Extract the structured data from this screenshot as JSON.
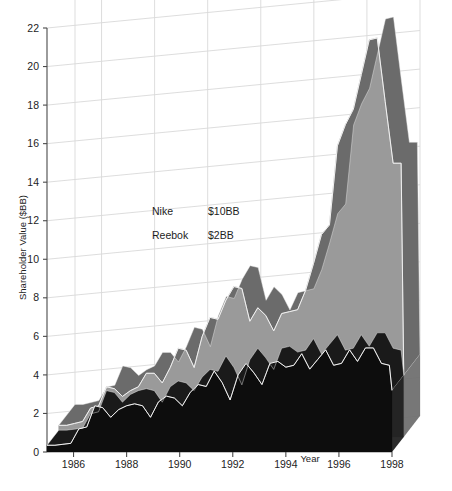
{
  "chart_data": {
    "type": "area",
    "title": "",
    "subtitle": "",
    "xlabel": "Year",
    "ylabel": "Shareholder Value ($BB)",
    "xlim": [
      1985,
      1998
    ],
    "ylim": [
      0,
      22
    ],
    "ytick_step": 2,
    "grid": true,
    "legend_position": "inside-upper-left",
    "style": "3d-ribbon",
    "y_ticks": [
      0,
      2,
      4,
      6,
      8,
      10,
      12,
      14,
      16,
      18,
      20,
      22
    ],
    "x_ticks": [
      1986,
      1988,
      1990,
      1992,
      1994,
      1996,
      1998
    ],
    "annotations": [
      {
        "label": "Nike",
        "value": "$10BB"
      },
      {
        "label": "Reebok",
        "value": "$2BB"
      }
    ],
    "x": [
      1985.0,
      1985.3,
      1985.6,
      1985.9,
      1986.2,
      1986.5,
      1986.8,
      1987.1,
      1987.4,
      1987.7,
      1988.0,
      1988.3,
      1988.6,
      1988.9,
      1989.2,
      1989.5,
      1989.8,
      1990.1,
      1990.4,
      1990.7,
      1991.0,
      1991.3,
      1991.6,
      1991.9,
      1992.2,
      1992.5,
      1992.8,
      1993.1,
      1993.4,
      1993.7,
      1994.0,
      1994.3,
      1994.6,
      1994.9,
      1995.2,
      1995.5,
      1995.8,
      1996.1,
      1996.4,
      1996.7,
      1997.0,
      1997.3,
      1997.6,
      1997.9,
      1998.0
    ],
    "series": [
      {
        "name": "Nike",
        "color_top": "#6b6b6b",
        "color_front": "#9a9a9a",
        "annotation": "$10BB",
        "values": [
          0.6,
          0.6,
          0.7,
          0.8,
          1.5,
          1.6,
          2.6,
          2.5,
          2.1,
          2.4,
          2.6,
          3.3,
          3.3,
          2.8,
          3.6,
          4.6,
          4.5,
          3.6,
          5.2,
          6.2,
          6.1,
          7.1,
          7.8,
          7.7,
          6.0,
          6.7,
          6.3,
          5.5,
          6.4,
          6.5,
          6.6,
          7.6,
          9.0,
          10.5,
          11.0,
          15.1,
          16.2,
          17.0,
          18.8,
          20.6,
          20.7,
          17.4,
          14.2,
          14.2,
          3.2
        ]
      },
      {
        "name": "Reebok",
        "color_top": "#1a1a1a",
        "color_front": "#0d0d0d",
        "annotation": "$2BB",
        "values": [
          0.35,
          0.35,
          0.4,
          0.45,
          1.2,
          1.3,
          2.4,
          2.3,
          1.8,
          2.2,
          2.4,
          2.5,
          2.4,
          1.8,
          2.6,
          2.9,
          2.8,
          2.4,
          3.1,
          3.5,
          3.4,
          4.2,
          3.6,
          2.7,
          4.0,
          4.6,
          4.1,
          3.5,
          4.6,
          4.7,
          4.4,
          4.5,
          5.1,
          4.3,
          4.8,
          5.3,
          4.5,
          4.6,
          5.3,
          4.7,
          5.4,
          5.4,
          4.6,
          4.5,
          3.2
        ]
      }
    ]
  }
}
